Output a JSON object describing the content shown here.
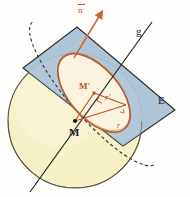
{
  "figure": {
    "labels": {
      "normal_vector": "n",
      "line": "g",
      "plane": "E",
      "sphere_center": "M",
      "circle_center": "M'",
      "circle_radius": "r'",
      "sphere_radius": "r"
    },
    "colors": {
      "plane_fill": "#a8c0d4",
      "plane_stroke": "#2c2c2c",
      "sphere_fill": "#f6f1c6",
      "sphere_stroke": "#4a4634",
      "ellipse_fill": "#fcf4dc",
      "ellipse_stroke": "#c0522a",
      "accent": "#c0522a",
      "line_stroke": "#222222",
      "background": "#fefefd"
    },
    "geometry": {
      "plane_corners": [
        [
          77,
          27
        ],
        [
          175,
          110
        ],
        [
          123,
          146
        ],
        [
          23,
          68
        ]
      ],
      "sphere_center_px": [
        75,
        121
      ],
      "sphere_radius_px": 67,
      "circle_center_px": [
        94,
        93
      ],
      "line_g_endpoints": [
        [
          152,
          22
        ],
        [
          30,
          192
        ]
      ],
      "normal_arrow": [
        [
          80,
          47
        ],
        [
          101,
          14
        ]
      ]
    }
  }
}
